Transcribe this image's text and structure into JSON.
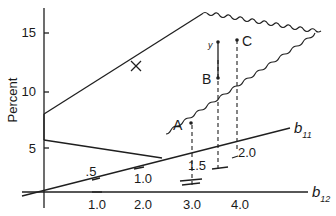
{
  "figure": {
    "y_axis": {
      "label": "Percent",
      "ticks": [
        {
          "label": "15",
          "value": 15
        },
        {
          "label": "10",
          "value": 10
        },
        {
          "label": "5",
          "value": 5
        }
      ]
    },
    "b12_axis": {
      "name": "b",
      "subscript": "12",
      "ticks": [
        "1.0",
        "2.0",
        "3.0",
        "4.0"
      ]
    },
    "b11_axis": {
      "name": "b",
      "subscript": "11",
      "ticks": [
        ".5",
        "1.0",
        "1.5",
        "2.0"
      ]
    },
    "points": {
      "A": "A",
      "B": "B",
      "C": "C",
      "y": "y"
    }
  }
}
